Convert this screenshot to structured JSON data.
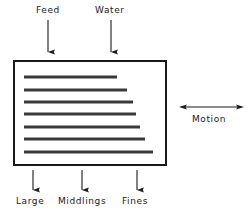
{
  "figure": {
    "type": "process-diagram",
    "background_color": "#ffffff",
    "line_color": "#1a1a1a",
    "riffle_color": "#3a3a3a"
  },
  "inlets": [
    {
      "label": "Feed",
      "arrow_x": 48,
      "arrow_y1": 20,
      "arrow_y2": 54,
      "label_x": 36,
      "label_y": 5,
      "direction": "down"
    },
    {
      "label": "Water",
      "arrow_x": 111,
      "arrow_y1": 20,
      "arrow_y2": 54,
      "label_x": 95,
      "label_y": 5,
      "direction": "down"
    }
  ],
  "deck": {
    "x": 13,
    "y": 60,
    "width": 154,
    "height": 106,
    "border_width": 2,
    "name": "table-deck"
  },
  "riffles": [
    {
      "index": 1,
      "x1": 24,
      "x2": 117,
      "y": 77
    },
    {
      "index": 2,
      "x1": 24,
      "x2": 127,
      "y": 90
    },
    {
      "index": 3,
      "x1": 24,
      "x2": 133,
      "y": 102
    },
    {
      "index": 4,
      "x1": 24,
      "x2": 136,
      "y": 114
    },
    {
      "index": 5,
      "x1": 24,
      "x2": 140,
      "y": 127
    },
    {
      "index": 6,
      "x1": 24,
      "x2": 145,
      "y": 139
    },
    {
      "index": 7,
      "x1": 24,
      "x2": 153,
      "y": 152
    }
  ],
  "outlets": [
    {
      "label": "Large",
      "arrow_x": 33,
      "arrow_y1": 170,
      "arrow_y2": 192,
      "label_x": 16,
      "label_y": 196,
      "direction": "down"
    },
    {
      "label": "Middlings",
      "arrow_x": 82,
      "arrow_y1": 170,
      "arrow_y2": 192,
      "label_x": 58,
      "label_y": 196,
      "direction": "down"
    },
    {
      "label": "Fines",
      "arrow_x": 137,
      "arrow_y1": 170,
      "arrow_y2": 192,
      "label_x": 122,
      "label_y": 196,
      "direction": "down"
    }
  ],
  "motion": {
    "label": "Motion",
    "arrow_x1": 179,
    "arrow_x2": 244,
    "arrow_y": 107,
    "direction": "bidirectional-horizontal",
    "label_x": 192,
    "label_y": 114
  }
}
